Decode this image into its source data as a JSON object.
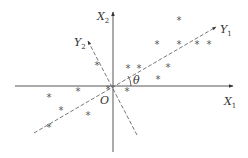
{
  "diagram": {
    "type": "coordinate rotation / principal component axes",
    "axes": {
      "x1": {
        "label": "X",
        "sub": "1"
      },
      "x2": {
        "label": "X",
        "sub": "2"
      },
      "y1": {
        "label": "Y",
        "sub": "1"
      },
      "y2": {
        "label": "Y",
        "sub": "2"
      }
    },
    "origin_label": "O",
    "angle_label": "θ",
    "point_glyph": "*",
    "points": [
      [
        179,
        24
      ],
      [
        157,
        48
      ],
      [
        179,
        48
      ],
      [
        197,
        48
      ],
      [
        209,
        48
      ],
      [
        128,
        72
      ],
      [
        139,
        72
      ],
      [
        168,
        71
      ],
      [
        97,
        69
      ],
      [
        158,
        83
      ],
      [
        127,
        95
      ],
      [
        108,
        93
      ],
      [
        49,
        101
      ],
      [
        78,
        95
      ],
      [
        61,
        114
      ],
      [
        88,
        119
      ],
      [
        49,
        131
      ]
    ],
    "colors": {
      "axis": "#444444",
      "dashed": "#555555",
      "point": "#555555"
    }
  }
}
